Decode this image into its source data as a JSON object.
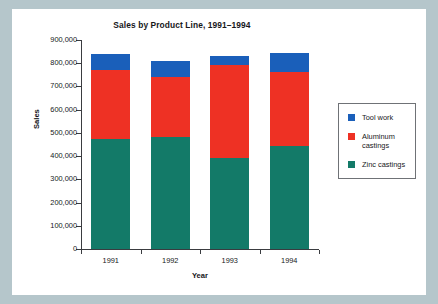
{
  "figure": {
    "background_color": "#ffffff",
    "outer_background_color": "#b5c6cb"
  },
  "chart_data": {
    "type": "bar",
    "subtype": "stacked-vertical",
    "title": "Sales by Product Line, 1991–1994",
    "xlabel": "Year",
    "ylabel": "Sales",
    "categories": [
      "1991",
      "1992",
      "1993",
      "1994"
    ],
    "ylim": [
      0,
      900000
    ],
    "yticks": [
      0,
      100000,
      200000,
      300000,
      400000,
      500000,
      600000,
      700000,
      800000,
      900000
    ],
    "ytick_labels": [
      "0",
      "100,000",
      "200,000",
      "300,000",
      "400,000",
      "500,000",
      "600,000",
      "700,000",
      "800,000",
      "900,000"
    ],
    "grid": false,
    "legend_position": "right",
    "series": [
      {
        "name": "Zinc castings",
        "color": "#137a68",
        "values": [
          475000,
          483000,
          390000,
          442000
        ]
      },
      {
        "name": "Aluminum castings",
        "color": "#ee3124",
        "values": [
          295000,
          257000,
          403000,
          320000
        ]
      },
      {
        "name": "Tool work",
        "color": "#1a5fba",
        "values": [
          70000,
          70000,
          40000,
          81000
        ]
      }
    ],
    "totals": [
      840000,
      810000,
      833000,
      843000
    ],
    "legend_order": [
      "Tool work",
      "Aluminum castings",
      "Zinc castings"
    ]
  },
  "legend": {
    "items": [
      {
        "label": "Tool work",
        "color": "#1a5fba"
      },
      {
        "label": "Aluminum castings",
        "color": "#ee3124"
      },
      {
        "label": "Zinc castings",
        "color": "#137a68"
      }
    ]
  }
}
